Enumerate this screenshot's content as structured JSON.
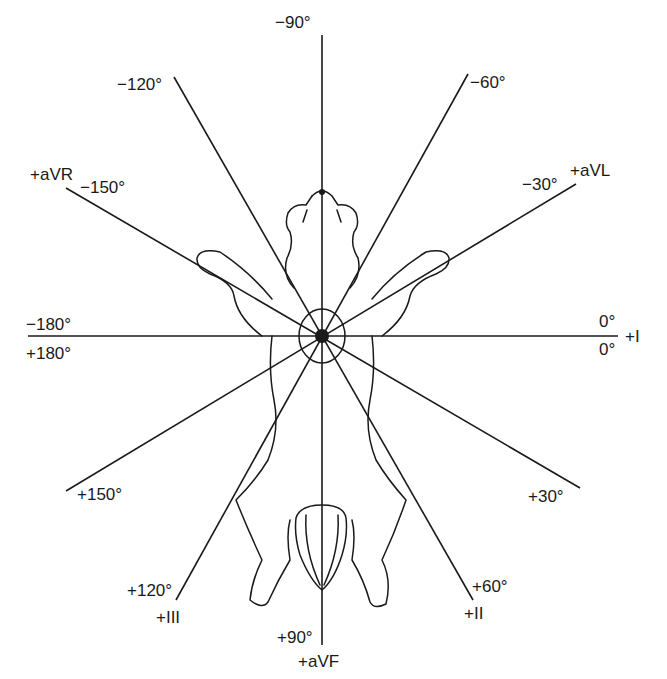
{
  "diagram": {
    "center": {
      "x": 322,
      "y": 336
    },
    "lines": [
      {
        "angle_label": "0°",
        "lead": "+I",
        "x2": 618,
        "y2": 336
      },
      {
        "angle_label": "+30°",
        "lead": "",
        "x2": 580,
        "y2": 488
      },
      {
        "angle_label": "+60°",
        "lead": "+II",
        "x2": 473,
        "y2": 600
      },
      {
        "angle_label": "+90°",
        "lead": "+aVF",
        "x2": 322,
        "y2": 645
      },
      {
        "angle_label": "+120°",
        "lead": "+III",
        "x2": 176,
        "y2": 600
      },
      {
        "angle_label": "+150°",
        "lead": "",
        "x2": 66,
        "y2": 491
      },
      {
        "angle_label": "−180°",
        "lead": "",
        "x2": 28,
        "y2": 336
      },
      {
        "angle_label": "−150°",
        "lead": "+aVR",
        "x2": 66,
        "y2": 188
      },
      {
        "angle_label": "−120°",
        "lead": "",
        "x2": 174,
        "y2": 77
      },
      {
        "angle_label": "−90°",
        "lead": "",
        "x2": 322,
        "y2": 35
      },
      {
        "angle_label": "−60°",
        "lead": "",
        "x2": 468,
        "y2": 74
      },
      {
        "angle_label": "−30°",
        "lead": "+aVL",
        "x2": 576,
        "y2": 184
      }
    ],
    "labels": {
      "minus90": "−90°",
      "minus120": "−120°",
      "minus60": "−60°",
      "aVR": "+aVR",
      "minus150": "−150°",
      "minus30": "−30°",
      "aVL": "+aVL",
      "minus180": "−180°",
      "plus180": "+180°",
      "zero_top": "0°",
      "zero_bottom": "0°",
      "leadI": "+I",
      "plus150": "+150°",
      "plus30": "+30°",
      "plus120": "+120°",
      "leadIII": "+III",
      "plus60": "+60°",
      "leadII": "+II",
      "plus90": "+90°",
      "aVF": "+aVF"
    },
    "colors": {
      "ink": "#1a1a1a",
      "background": "#ffffff"
    }
  }
}
